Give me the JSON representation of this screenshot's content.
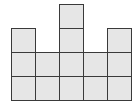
{
  "diagram": {
    "type": "unit-square-block-figure",
    "columns": 5,
    "column_heights": [
      3,
      2,
      4,
      2,
      3
    ],
    "total_squares": 14,
    "cell_size_px": 24,
    "origin": {
      "left": 11,
      "bottom": 100
    },
    "colors": {
      "fill": "#e6e6e6",
      "stroke": "#3a3a3a",
      "background": "#ffffff"
    }
  }
}
